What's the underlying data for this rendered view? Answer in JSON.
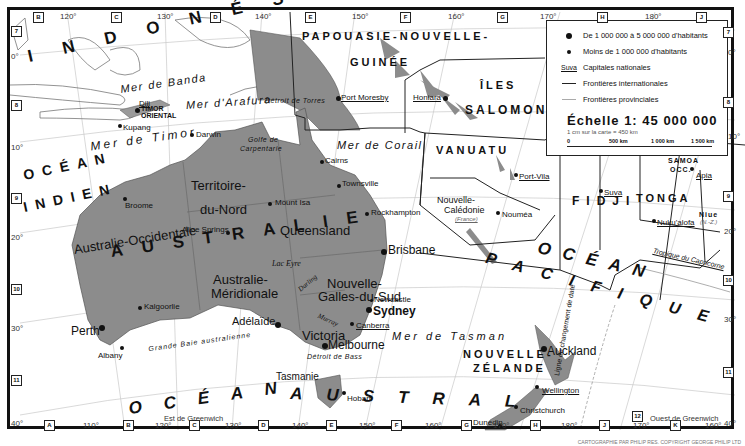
{
  "map": {
    "land_color": "#8c8c8c",
    "sea_color": "#ffffff",
    "border_color": "#222222"
  },
  "legend": {
    "items": [
      {
        "symbol": "large-dot",
        "label": "De 1 000 000  à  5 000 000 d'habitants"
      },
      {
        "symbol": "small-dot",
        "label": "Moins de 1 000 000  d'habitants"
      },
      {
        "symbol": "underline",
        "sample": "Suva",
        "label": "Capitales nationales"
      },
      {
        "symbol": "dark-line",
        "label": "Frontières internationales"
      },
      {
        "symbol": "light-line",
        "label": "Frontières provinciales"
      }
    ],
    "scale_title": "Échelle 1: 45 000 000",
    "scale_subtitle": "1 cm sur la carte = 450 km",
    "scale_ticks": [
      "0",
      "500 km",
      "1 000 km",
      "1 500 km"
    ]
  },
  "countries": {
    "indonesia": "I N D O N É S I E",
    "png_line1": "PAPOUASIE-NOUVELLE-",
    "png_line2": "GUINÉE",
    "solomon_line1": "ÎLES",
    "solomon_line2": "SALOMON",
    "vanuatu": "VANUATU",
    "fiji": "FIDJI",
    "tonga": "TONGA",
    "samoa_line1": "SAMOA",
    "samoa_line2": "OCC.",
    "niue": "Niue",
    "niue_note": "(N.-Z.)",
    "timor_line1": "TIMOR",
    "timor_line2": "ORIENTAL",
    "australia": "AUSTRALIE",
    "nz_line1": "NOUVELLE-",
    "nz_line2": "ZÉLANDE",
    "new_caledonia_line1": "Nouvelle-",
    "new_caledonia_line2": "Calédonie",
    "new_caledonia_note": "(France)",
    "tasmania": "Tasmanie"
  },
  "regions": {
    "nt_line1": "Territoire-",
    "nt_line2": "du-Nord",
    "qld": "Queensland",
    "wa": "Australie-Occidentale",
    "sa_line1": "Australie-",
    "sa_line2": "Méridionale",
    "nsw_line1": "Nouvelle-",
    "nsw_line2": "Galles-du-Sud",
    "vic": "Victoria"
  },
  "oceans": {
    "indian_line1": "OCÉAN",
    "indian_line2": "INDIEN",
    "pacific_line1": "OCÉAN",
    "pacific_line2": "PACIFIQUE",
    "southern_line1": "OCÉAN",
    "southern_line2": "AUSTRAL"
  },
  "seas": {
    "banda": "Mer de Banda",
    "arafura": "Mer d'Arafura",
    "timor": "Mer de Timor",
    "coral": "Mer de Corail",
    "tasman": "Mer de Tasman",
    "torres": "Détroit de Torres",
    "carpentaria_line1": "Golfe de",
    "carpentaria_line2": "Carpentarie",
    "bight": "Grande Baie australienne",
    "bass": "Détroit de Bass",
    "lake_eyre": "Lac Eyre",
    "darling": "Darling",
    "murray": "Murray",
    "capricorn": "Tropique du Capricorne",
    "dateline": "Ligne de changement de date"
  },
  "cities": [
    {
      "name": "Dili",
      "capital": true
    },
    {
      "name": "Kupang"
    },
    {
      "name": "Darwin"
    },
    {
      "name": "Port Moresby",
      "capital": true
    },
    {
      "name": "Honiara",
      "capital": true
    },
    {
      "name": "Cairns"
    },
    {
      "name": "Townsville"
    },
    {
      "name": "Mount Isa"
    },
    {
      "name": "Broome"
    },
    {
      "name": "Alice Springs"
    },
    {
      "name": "Rockhampton"
    },
    {
      "name": "Brisbane"
    },
    {
      "name": "Port-Vila",
      "capital": true
    },
    {
      "name": "Nouméa"
    },
    {
      "name": "Suva",
      "capital": true
    },
    {
      "name": "Apia",
      "capital": true
    },
    {
      "name": "Nuku'alofa",
      "capital": true
    },
    {
      "name": "Kalgoorlie"
    },
    {
      "name": "Perth"
    },
    {
      "name": "Albany"
    },
    {
      "name": "Adélaïde"
    },
    {
      "name": "Newcastle"
    },
    {
      "name": "Sydney"
    },
    {
      "name": "Canberra",
      "capital": true
    },
    {
      "name": "Melbourne"
    },
    {
      "name": "Hobart"
    },
    {
      "name": "Auckland"
    },
    {
      "name": "Wellington",
      "capital": true
    },
    {
      "name": "Christchurch"
    },
    {
      "name": "Dunedin"
    }
  ],
  "grid": {
    "top_cols": [
      "B",
      "C",
      "D",
      "E",
      "F",
      "G",
      "H",
      "J"
    ],
    "top_lons": [
      "120°",
      "130°",
      "140°",
      "150°",
      "160°",
      "170°",
      "180°"
    ],
    "bottom_cols": [
      "A",
      "B",
      "C",
      "D",
      "E",
      "F",
      "G",
      "H",
      "J",
      "K"
    ],
    "bottom_lons": [
      "110°",
      "120°",
      "130°",
      "140°",
      "150°",
      "160°",
      "170°",
      "180°",
      "170°",
      "160°"
    ],
    "left_rows": [
      "7",
      "8",
      "9",
      "10",
      "11"
    ],
    "right_rows": [
      "7",
      "8",
      "9",
      "10",
      "11"
    ],
    "left_lats": [
      "0°",
      "10°",
      "20°",
      "30°",
      "40°"
    ],
    "right_lats": [
      "0°",
      "10°",
      "20°",
      "30°",
      "40°"
    ],
    "row12": "12",
    "east_label": "Est de Greenwich",
    "west_label": "Ouest de Greenwich"
  },
  "credit": "CARTOGRAPHIE PAR PHILIP RES. COPYRIGHT GEORGE PHILIP LTD"
}
